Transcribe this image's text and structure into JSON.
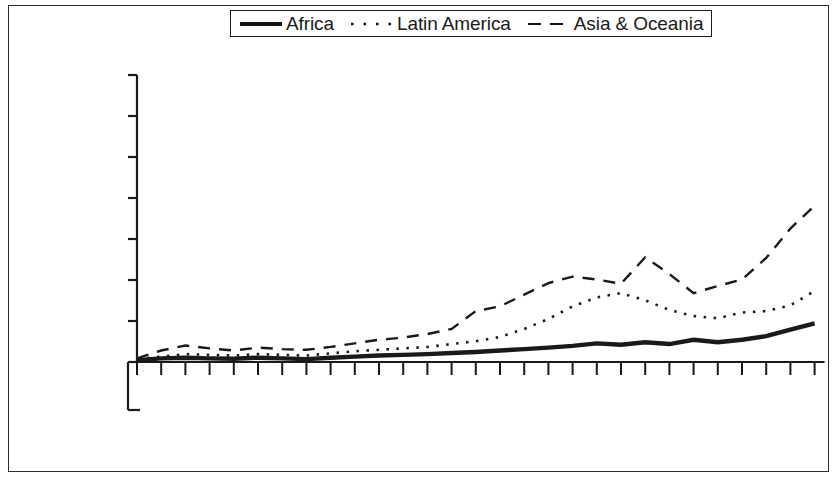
{
  "figure": {
    "background_color": "#ffffff",
    "frame_color": "#2c2c2c",
    "line_color": "#1a1a1a"
  },
  "legend": {
    "position": "top-center",
    "bordered": true,
    "entries": [
      {
        "label": "Africa",
        "style": "solid-thick",
        "icon": "legend-line-solid-icon"
      },
      {
        "label": "Latin America",
        "style": "dotted",
        "icon": "legend-line-dotted-icon"
      },
      {
        "label": "Asia & Oceania",
        "style": "dashed-long",
        "icon": "legend-line-dashed-icon"
      }
    ]
  },
  "axes": {
    "y_axis": {
      "label": "",
      "tick_labels": [],
      "tick_count": 8,
      "note": "tick marks only; numeric labels not visible in image"
    },
    "x_axis": {
      "label": "",
      "tick_count": 29,
      "labels_rotated": true,
      "labels_truncated": true,
      "visible_tick_labels": [
        "19",
        "19",
        "19",
        "19",
        "19",
        "19",
        "19",
        "19",
        "19",
        "20",
        "20",
        "20",
        "20"
      ]
    }
  },
  "chart_data": {
    "type": "line",
    "title": "",
    "subtitle": "",
    "xlabel": "",
    "ylabel": "",
    "grid": false,
    "legend_position": "top-center",
    "axis_note": "Y-axis tick values are not rendered in the source image; values below are read off the 8 y tick gridline positions as index units (0 at baseline, 8 at top tick).",
    "x": [
      1,
      2,
      3,
      4,
      5,
      6,
      7,
      8,
      9,
      10,
      11,
      12,
      13,
      14,
      15,
      16,
      17,
      18,
      19,
      20,
      21,
      22,
      23,
      24,
      25,
      26,
      27,
      28,
      29
    ],
    "xtick_labels_visible": [
      "19",
      "",
      "",
      "19",
      "",
      "",
      "19",
      "",
      "",
      "19",
      "",
      "",
      "19",
      "",
      "",
      "19",
      "",
      "",
      "19",
      "",
      "",
      "19",
      "",
      "",
      "20",
      "",
      "",
      "20",
      ""
    ],
    "ylim": [
      0,
      8
    ],
    "series": [
      {
        "name": "Africa",
        "style": "solid-thick",
        "values": [
          0.05,
          0.1,
          0.12,
          0.1,
          0.09,
          0.12,
          0.1,
          0.08,
          0.12,
          0.15,
          0.18,
          0.2,
          0.22,
          0.25,
          0.28,
          0.32,
          0.36,
          0.4,
          0.45,
          0.52,
          0.48,
          0.55,
          0.5,
          0.62,
          0.55,
          0.62,
          0.72,
          0.9,
          1.08
        ]
      },
      {
        "name": "Latin America",
        "style": "dotted",
        "values": [
          0.08,
          0.15,
          0.22,
          0.2,
          0.18,
          0.22,
          0.2,
          0.18,
          0.24,
          0.3,
          0.34,
          0.38,
          0.42,
          0.5,
          0.58,
          0.7,
          0.92,
          1.2,
          1.55,
          1.8,
          1.92,
          1.72,
          1.45,
          1.28,
          1.22,
          1.38,
          1.42,
          1.58,
          1.98
        ]
      },
      {
        "name": "Asia & Oceania",
        "style": "dashed-long",
        "values": [
          0.1,
          0.32,
          0.46,
          0.38,
          0.32,
          0.4,
          0.36,
          0.34,
          0.42,
          0.52,
          0.62,
          0.68,
          0.78,
          0.92,
          1.42,
          1.55,
          1.88,
          2.2,
          2.38,
          2.3,
          2.18,
          2.92,
          2.45,
          1.92,
          2.12,
          2.3,
          2.9,
          3.72,
          4.36
        ]
      }
    ]
  }
}
